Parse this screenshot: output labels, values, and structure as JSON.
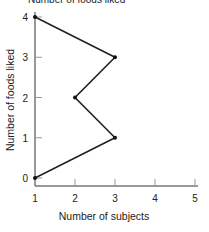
{
  "chart_data": {
    "type": "line",
    "title": "Number of foods liked",
    "xlabel": "Number of subjects",
    "ylabel": "Number of foods liked",
    "xticks": [
      "1",
      "2",
      "3",
      "4",
      "5"
    ],
    "yticks": [
      "0",
      "1",
      "2",
      "3",
      "4"
    ],
    "xlim": [
      1,
      5
    ],
    "ylim": [
      0,
      4
    ],
    "grid": false,
    "points": [
      {
        "x": 1,
        "y": 4
      },
      {
        "x": 3,
        "y": 3
      },
      {
        "x": 2,
        "y": 2
      },
      {
        "x": 3,
        "y": 1
      },
      {
        "x": 1,
        "y": 0
      }
    ]
  }
}
